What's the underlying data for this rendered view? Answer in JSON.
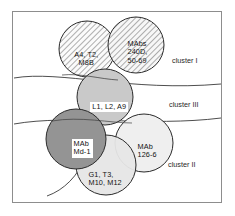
{
  "figure": {
    "type": "venn-cluster-diagram",
    "title": "",
    "background_color": "#ffffff",
    "frame_color": "#8d8d8d"
  },
  "circles": [
    {
      "id": "circle-a4-t2-m8b",
      "label": "A4, T2,\nM8B",
      "fill": "hatched",
      "fill_color": "#f2f2f2",
      "stroke": "#2b2b2b",
      "cx": 87,
      "cy": 49,
      "r": 28
    },
    {
      "id": "circle-mabs-240d",
      "label": "MAbs\n240D,\n50-69",
      "fill": "hatched",
      "fill_color": "#ececec",
      "stroke": "#2b2b2b",
      "cx": 136,
      "cy": 45,
      "r": 28
    },
    {
      "id": "circle-l1-l2-a9",
      "label": "L1, L2, A9",
      "fill": "solid",
      "fill_color": "#c9c9c9",
      "stroke": "#2b2b2b",
      "cx": 105,
      "cy": 97,
      "r": 28
    },
    {
      "id": "circle-mab-md-1",
      "label": "MAb\nMd-1",
      "fill": "solid",
      "fill_color": "#949494",
      "stroke": "#2b2b2b",
      "cx": 76,
      "cy": 139,
      "r": 30
    },
    {
      "id": "circle-mab-126-6",
      "label": "MAb\n126-6",
      "fill": "solid",
      "fill_color": "#efefef",
      "stroke": "#2b2b2b",
      "cx": 144,
      "cy": 143,
      "r": 29
    },
    {
      "id": "circle-g1-t3-m10-m12",
      "label": "G1, T3,\nM10, M12",
      "fill": "solid",
      "fill_color": "#e6e6e6",
      "stroke": "#2b2b2b",
      "cx": 106,
      "cy": 165,
      "r": 30
    }
  ],
  "clusters": [
    {
      "id": "cluster-i",
      "label": "cluster I"
    },
    {
      "id": "cluster-iii",
      "label": "cluster III"
    },
    {
      "id": "cluster-ii",
      "label": "cluster II"
    }
  ],
  "dividers": [
    {
      "id": "divider-upper",
      "description": "curve separating cluster I from cluster III"
    },
    {
      "id": "divider-lower",
      "description": "curve separating cluster III from cluster II"
    },
    {
      "id": "divider-bottom-left",
      "description": "short arc at lower-left of cluster II"
    }
  ]
}
